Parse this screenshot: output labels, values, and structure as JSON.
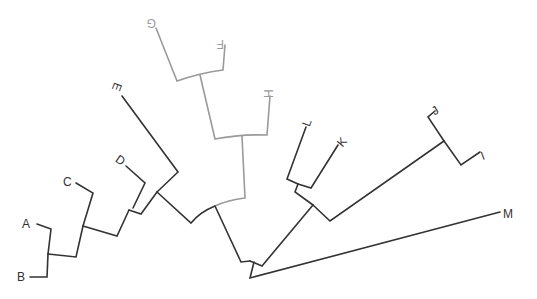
{
  "diagram": {
    "type": "phylogenetic-tree",
    "layout": "radial-fan",
    "colors": {
      "primary": "#333333",
      "highlight": "#9a9a9a"
    },
    "labels": [
      {
        "id": "A",
        "text": "A",
        "x": 22,
        "y": 228,
        "rot": 0,
        "group": "primary"
      },
      {
        "id": "B",
        "text": "B",
        "x": 17,
        "y": 281,
        "rot": 0,
        "group": "primary"
      },
      {
        "id": "C",
        "text": "C",
        "x": 63,
        "y": 186,
        "rot": 0,
        "group": "primary"
      },
      {
        "id": "D",
        "text": "D",
        "x": 116,
        "y": 164,
        "rot": 35,
        "group": "primary"
      },
      {
        "id": "E",
        "text": "E",
        "x": 113,
        "y": 91,
        "rot": 110,
        "group": "primary"
      },
      {
        "id": "G",
        "text": "G",
        "x": 148,
        "y": 27,
        "rot": 180,
        "group": "highlight"
      },
      {
        "id": "F",
        "text": "F",
        "x": 216,
        "y": 48,
        "rot": 180,
        "group": "highlight"
      },
      {
        "id": "H",
        "text": "H",
        "x": 265,
        "y": 98,
        "rot": -90,
        "group": "highlight"
      },
      {
        "id": "L",
        "text": "L",
        "x": 303,
        "y": 126,
        "rot": -70,
        "group": "primary"
      },
      {
        "id": "K",
        "text": "K",
        "x": 338,
        "y": 146,
        "rot": -50,
        "group": "primary"
      },
      {
        "id": "J",
        "text": "J",
        "x": 432,
        "y": 114,
        "rot": -30,
        "group": "primary"
      },
      {
        "id": "I",
        "text": "I",
        "x": 481,
        "y": 159,
        "rot": -20,
        "group": "primary"
      },
      {
        "id": "M",
        "text": "M",
        "x": 503,
        "y": 218,
        "rot": 0,
        "group": "primary"
      }
    ],
    "branches": [
      {
        "id": "b-leaf-B",
        "group": "primary",
        "d": "M30,277 L47,277 L48,254"
      },
      {
        "id": "b-leaf-A",
        "group": "primary",
        "d": "M37,224 L51,229 L48,254"
      },
      {
        "id": "b-AB",
        "group": "primary",
        "d": "M48,254 L76,257 L83,226"
      },
      {
        "id": "b-leaf-C",
        "group": "primary",
        "d": "M76,183 L93,193 L83,226"
      },
      {
        "id": "b-ABC",
        "group": "primary",
        "d": "M83,226 L117,236 L129,210"
      },
      {
        "id": "b-leaf-D",
        "group": "primary",
        "d": "M126,166 L145,183 L133,208"
      },
      {
        "id": "b-ABCD",
        "group": "primary",
        "d": "M129,210 L141,214 L157,192"
      },
      {
        "id": "b-leaf-E",
        "group": "primary",
        "d": "M122,96 L178,172 L157,192"
      },
      {
        "id": "b-ABCDE",
        "group": "primary",
        "d": "M157,192 L191,223 Q200,212 215,206"
      },
      {
        "id": "b-leaf-G",
        "group": "highlight",
        "d": "M156,28 L177,81 Q200,73 223,70 L225,45"
      },
      {
        "id": "b-FG",
        "group": "highlight",
        "d": "M200,75 L215,139 Q240,134 267,135 L270,96"
      },
      {
        "id": "b-FGH",
        "group": "highlight",
        "d": "M242,136 L245,198 Q228,200 215,206"
      },
      {
        "id": "b-left-clade",
        "group": "primary",
        "d": "M215,206 L241,262 L250,261"
      },
      {
        "id": "b-leaf-L",
        "group": "primary",
        "d": "M306,127 L287,179 L298,184"
      },
      {
        "id": "b-leaf-K",
        "group": "primary",
        "d": "M338,145 L311,188 L298,184"
      },
      {
        "id": "b-LK",
        "group": "primary",
        "d": "M298,184 L295,192 L313,205"
      },
      {
        "id": "b-leaf-J",
        "group": "primary",
        "d": "M435,111 L428,117 L444,141"
      },
      {
        "id": "b-leaf-I",
        "group": "primary",
        "d": "M480,152 L461,165 L444,141"
      },
      {
        "id": "b-IJ",
        "group": "primary",
        "d": "M444,141 L330,221 L313,205"
      },
      {
        "id": "b-right-clade",
        "group": "primary",
        "d": "M313,205 L262,266 L250,261"
      },
      {
        "id": "b-root",
        "group": "primary",
        "d": "M254,262 L250,278 L500,212"
      }
    ]
  }
}
